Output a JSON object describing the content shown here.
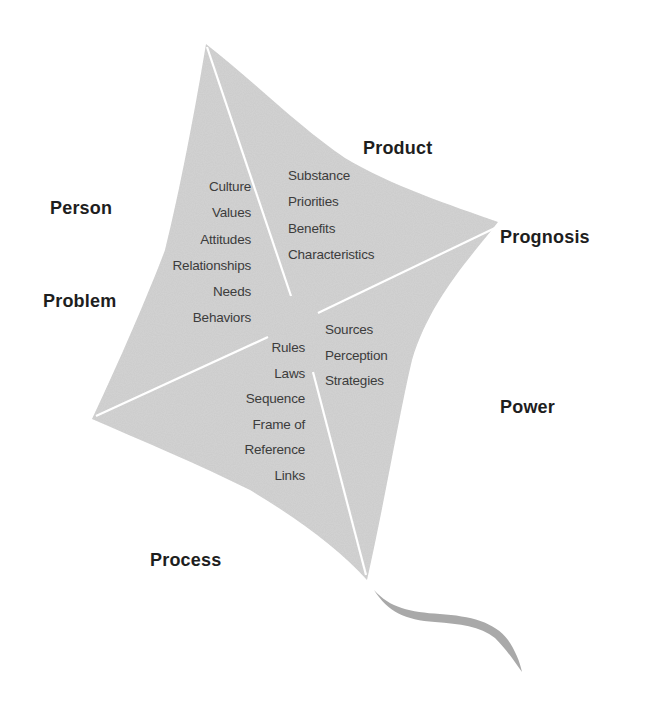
{
  "diagram": {
    "type": "kite",
    "colors": {
      "kite_fill": "#d4d4d4",
      "divider_lines": "#ffffff",
      "tail": "#a9a9a9",
      "label_text": "#1e1e1e",
      "item_text": "#3c3c3c"
    },
    "outer_labels": {
      "product": "Product",
      "person": "Person",
      "prognosis": "Prognosis",
      "problem": "Problem",
      "power": "Power",
      "process": "Process"
    },
    "quadrants": {
      "person_problem": [
        "Culture",
        "Values",
        "Attitudes",
        "Relationships",
        "Needs",
        "Behaviors"
      ],
      "product_prognosis": [
        "Substance",
        "Priorities",
        "Benefits",
        "Characteristics"
      ],
      "process": [
        "Rules",
        "Laws",
        "Sequence",
        "Frame of",
        "Reference",
        "Links"
      ],
      "power": [
        "Sources",
        "Perception",
        "Strategies"
      ]
    }
  }
}
